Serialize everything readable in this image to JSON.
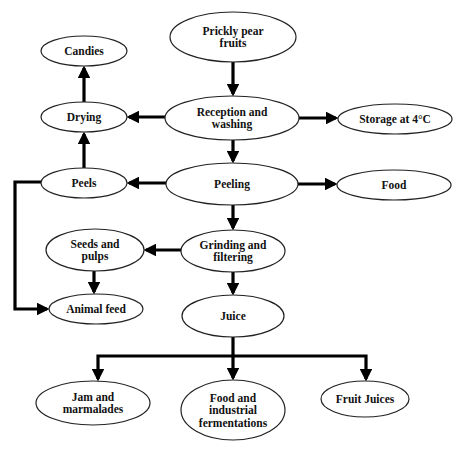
{
  "diagram": {
    "type": "flowchart",
    "title": "",
    "colors": {
      "background": "#ffffff",
      "node_fill": "#ffffff",
      "node_stroke": "#222222",
      "edge": "#000000",
      "text": "#111111"
    },
    "nodes": [
      {
        "id": "prickly_pear_fruits",
        "lines": [
          "Prickly pear",
          "fruits"
        ],
        "cx": 233,
        "cy": 37,
        "rx": 63,
        "ry": 25
      },
      {
        "id": "candies",
        "lines": [
          "Candies"
        ],
        "cx": 84,
        "cy": 51,
        "rx": 43,
        "ry": 15
      },
      {
        "id": "drying",
        "lines": [
          "Drying"
        ],
        "cx": 84,
        "cy": 117,
        "rx": 43,
        "ry": 15
      },
      {
        "id": "reception_washing",
        "lines": [
          "Reception and",
          "washing"
        ],
        "cx": 232,
        "cy": 118,
        "rx": 67,
        "ry": 22
      },
      {
        "id": "storage",
        "lines": [
          "Storage at 4°C"
        ],
        "cx": 395,
        "cy": 119,
        "rx": 57,
        "ry": 15
      },
      {
        "id": "peels",
        "lines": [
          "Peels"
        ],
        "cx": 84,
        "cy": 183,
        "rx": 43,
        "ry": 15
      },
      {
        "id": "peeling",
        "lines": [
          "Peeling"
        ],
        "cx": 232,
        "cy": 184,
        "rx": 66,
        "ry": 21
      },
      {
        "id": "food",
        "lines": [
          "Food"
        ],
        "cx": 394,
        "cy": 185,
        "rx": 57,
        "ry": 15
      },
      {
        "id": "seeds_pulps",
        "lines": [
          "Seeds and",
          "pulps"
        ],
        "cx": 95,
        "cy": 250,
        "rx": 49,
        "ry": 21
      },
      {
        "id": "grinding_filtering",
        "lines": [
          "Grinding and",
          "filtering"
        ],
        "cx": 233,
        "cy": 251,
        "rx": 52,
        "ry": 21
      },
      {
        "id": "animal_feed",
        "lines": [
          "Animal feed"
        ],
        "cx": 96,
        "cy": 309,
        "rx": 47,
        "ry": 15
      },
      {
        "id": "juice",
        "lines": [
          "Juice"
        ],
        "cx": 233,
        "cy": 316,
        "rx": 51,
        "ry": 21
      },
      {
        "id": "jam_marmalades",
        "lines": [
          "Jam and",
          "marmalades"
        ],
        "cx": 93,
        "cy": 403,
        "rx": 57,
        "ry": 22
      },
      {
        "id": "food_industrial_fermentations",
        "lines": [
          "Food and",
          "industrial",
          "fermentations"
        ],
        "cx": 233,
        "cy": 410,
        "rx": 52,
        "ry": 30
      },
      {
        "id": "fruit_juices",
        "lines": [
          "Fruit Juices"
        ],
        "cx": 365,
        "cy": 399,
        "rx": 44,
        "ry": 18
      }
    ],
    "edges": [
      {
        "from": "prickly_pear_fruits",
        "to": "reception_washing",
        "points": [
          [
            233,
            62
          ],
          [
            233,
            94
          ]
        ]
      },
      {
        "from": "reception_washing",
        "to": "drying",
        "points": [
          [
            165,
            117
          ],
          [
            129,
            117
          ]
        ]
      },
      {
        "from": "reception_washing",
        "to": "storage",
        "points": [
          [
            299,
            118
          ],
          [
            336,
            118
          ]
        ]
      },
      {
        "from": "drying",
        "to": "candies",
        "points": [
          [
            84,
            102
          ],
          [
            84,
            68
          ]
        ]
      },
      {
        "from": "reception_washing",
        "to": "peeling",
        "points": [
          [
            233,
            140
          ],
          [
            233,
            161
          ]
        ]
      },
      {
        "from": "peels",
        "to": "drying",
        "points": [
          [
            84,
            168
          ],
          [
            84,
            134
          ]
        ]
      },
      {
        "from": "peeling",
        "to": "peels",
        "points": [
          [
            166,
            183
          ],
          [
            129,
            183
          ]
        ]
      },
      {
        "from": "peeling",
        "to": "food",
        "points": [
          [
            298,
            184
          ],
          [
            335,
            184
          ]
        ]
      },
      {
        "from": "peels",
        "to": "animal_feed",
        "points": [
          [
            41,
            182
          ],
          [
            15,
            182
          ],
          [
            15,
            309
          ],
          [
            47,
            309
          ]
        ]
      },
      {
        "from": "peeling",
        "to": "grinding_filtering",
        "points": [
          [
            233,
            205
          ],
          [
            233,
            228
          ]
        ]
      },
      {
        "from": "grinding_filtering",
        "to": "seeds_pulps",
        "points": [
          [
            181,
            250
          ],
          [
            146,
            250
          ]
        ]
      },
      {
        "from": "seeds_pulps",
        "to": "animal_feed",
        "points": [
          [
            94,
            271
          ],
          [
            94,
            292
          ]
        ]
      },
      {
        "from": "grinding_filtering",
        "to": "juice",
        "points": [
          [
            233,
            272
          ],
          [
            233,
            293
          ]
        ]
      },
      {
        "from": "juice",
        "to": "jam_marmalades",
        "points": [
          [
            233,
            337
          ],
          [
            233,
            356
          ],
          [
            98,
            356
          ],
          [
            98,
            379
          ]
        ]
      },
      {
        "from": "juice",
        "to": "food_industrial_fermentations",
        "points": [
          [
            233,
            356
          ],
          [
            233,
            378
          ]
        ]
      },
      {
        "from": "juice",
        "to": "fruit_juices",
        "points": [
          [
            233,
            356
          ],
          [
            366,
            356
          ],
          [
            366,
            379
          ]
        ]
      }
    ]
  }
}
